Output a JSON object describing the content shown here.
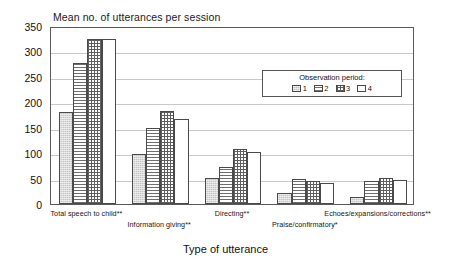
{
  "chart_data": {
    "type": "bar",
    "title": "Mean no. of utterances per session",
    "xlabel": "Type of utterance",
    "ylabel": "",
    "ylim": [
      0,
      350
    ],
    "ytick_step": 50,
    "yticks": [
      350,
      300,
      250,
      200,
      150,
      100,
      50,
      0
    ],
    "grid": true,
    "legend": {
      "position": "inside-upper-right",
      "title": "Observation period:",
      "entries": [
        "1",
        "2",
        "3",
        "4"
      ]
    },
    "categories": [
      "Total speech to child**",
      "Information giving**",
      "Directing**",
      "Praise/confirmatory*",
      "Echoes/expansions/corrections**"
    ],
    "series": [
      {
        "name": "1",
        "pattern": "light-stipple",
        "values": [
          180,
          99,
          52,
          22,
          13
        ]
      },
      {
        "name": "2",
        "pattern": "horizontal-lines",
        "values": [
          277,
          150,
          73,
          49,
          45
        ]
      },
      {
        "name": "3",
        "pattern": "checkerboard",
        "values": [
          325,
          183,
          108,
          46,
          51
        ]
      },
      {
        "name": "4",
        "pattern": "dots",
        "values": [
          325,
          168,
          103,
          42,
          48
        ]
      }
    ]
  },
  "axis": {
    "y_tick_labels": [
      "350",
      "300",
      "250",
      "200",
      "150",
      "100",
      "50",
      "0"
    ],
    "x_title": "Type of utterance"
  },
  "legend": {
    "title": "Observation period:",
    "items": [
      {
        "label": "1"
      },
      {
        "label": "2"
      },
      {
        "label": "3"
      },
      {
        "label": "4"
      }
    ]
  },
  "title": {
    "text": "Mean no. of utterances per session"
  }
}
